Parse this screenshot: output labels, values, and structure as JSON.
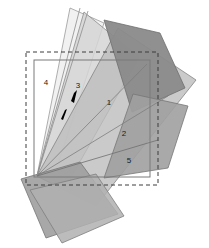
{
  "figure": {
    "canvas": {
      "width": 209,
      "height": 248,
      "background": "#ffffff"
    },
    "apex": {
      "x": 37,
      "y": 176
    },
    "colors": {
      "background": "#ffffff",
      "sector_lightest": "#f2f2f2",
      "sector_light": "#d7d7d7",
      "sector_mid": "#c4c4c4",
      "sector_base": "#b6b6b6",
      "sector_dark": "#9d9d9d",
      "sector_darkest": "#8a8a8a",
      "outline": "#6e6e6e",
      "dashed_boundary": "#3c3c3c",
      "inner_rect_stroke": "#7a7a7a",
      "label_text": "#1a1a1a",
      "arrow_marker": "#000000"
    },
    "boundary_rect": {
      "name": "dashed-boundary-rect",
      "x": 26,
      "y": 52,
      "width": 132,
      "height": 133,
      "stroke": "#3c3c3c",
      "stroke_width": 1,
      "dash_pattern": "4 3",
      "fill": "none"
    },
    "inner_rect": {
      "name": "inner-solid-rect",
      "x": 34,
      "y": 60,
      "width": 116,
      "height": 117,
      "stroke": "#7a7a7a",
      "stroke_width": 1,
      "fill": "none"
    },
    "quads": [
      {
        "name": "quad-lightest-upper-left",
        "points": "37,176 70,8 104,23 52,183",
        "fill": "#f0f0f0",
        "stroke": "#9a9a9a",
        "opacity": 0.95
      },
      {
        "name": "quad-light-upper-center",
        "points": "37,176 84,12 139,57 64,190",
        "fill": "#d5d5d5",
        "stroke": "#8c8c8c",
        "opacity": 0.85
      },
      {
        "name": "quad-mid-right-fan",
        "points": "37,176 118,28 196,80 96,206",
        "fill": "#bdbdbd",
        "stroke": "#848484",
        "opacity": 0.8
      },
      {
        "name": "quad-darkest-upper-right",
        "points": "104,20 160,33 185,88 132,112",
        "fill": "#8a8a8a",
        "stroke": "#6e6e6e",
        "opacity": 0.95
      },
      {
        "name": "quad-dark-lower-right",
        "points": "133,94 188,106 168,168 104,178",
        "fill": "#a0a0a0",
        "stroke": "#767676",
        "opacity": 0.9
      },
      {
        "name": "quad-dark-lower-left",
        "points": "21,179 80,162 118,214 46,238",
        "fill": "#9e9e9e",
        "stroke": "#757575",
        "opacity": 0.9
      },
      {
        "name": "quad-mid-lower-center",
        "points": "30,190 96,174 124,216 62,243",
        "fill": "#b0b0b0",
        "stroke": "#7d7d7d",
        "opacity": 0.85
      }
    ],
    "rays": [
      {
        "name": "ray-boundary-1",
        "x1": 37,
        "y1": 176,
        "x2": 80,
        "y2": 8
      },
      {
        "name": "ray-boundary-2",
        "x1": 37,
        "y1": 176,
        "x2": 88,
        "y2": 11
      },
      {
        "name": "ray-boundary-3",
        "x1": 37,
        "y1": 176,
        "x2": 147,
        "y2": 64
      },
      {
        "name": "ray-boundary-4",
        "x1": 37,
        "y1": 176,
        "x2": 168,
        "y2": 96
      },
      {
        "name": "ray-boundary-5",
        "x1": 37,
        "y1": 176,
        "x2": 158,
        "y2": 140
      }
    ],
    "sector_labels": [
      {
        "name": "sector-label-1",
        "text": "1",
        "x": 109,
        "y": 103
      },
      {
        "name": "sector-label-2",
        "text": "2",
        "x": 124,
        "y": 134
      },
      {
        "name": "sector-label-3",
        "text": "3",
        "x": 78,
        "y": 86
      },
      {
        "name": "sector-label-4",
        "text": "4",
        "x": 46,
        "y": 83
      },
      {
        "name": "sector-label-5",
        "text": "5",
        "x": 129,
        "y": 161
      }
    ],
    "arrow_marker": {
      "name": "direction-arrow-marker",
      "head_points": "74,93 77,90 74,103 71,101",
      "tail_points": "65,110 67,109 63,120 61,119",
      "color": "#000000"
    }
  }
}
